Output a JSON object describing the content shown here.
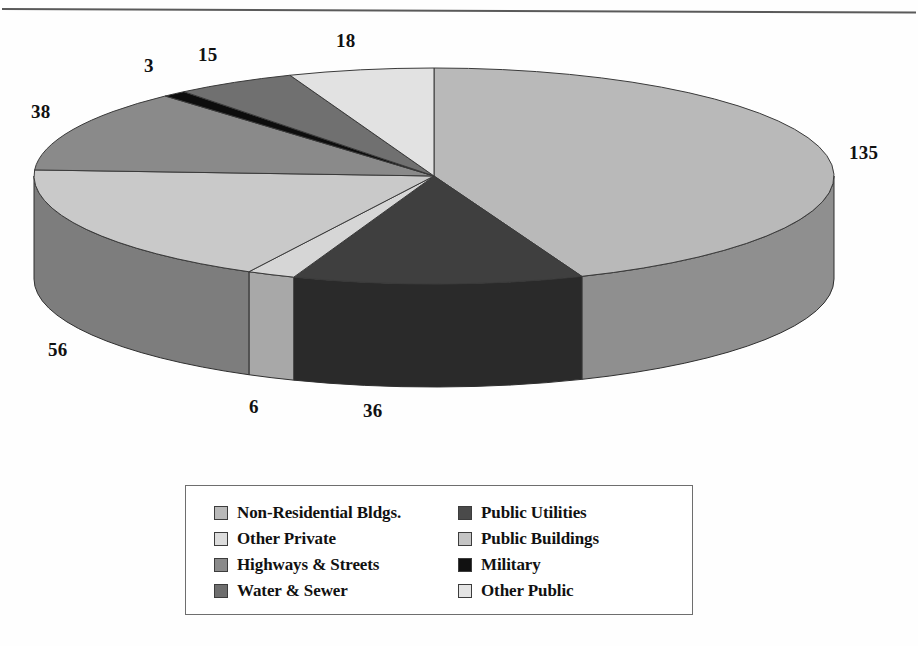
{
  "chart_data": {
    "type": "pie",
    "title": "",
    "subtitle": "",
    "xlabel": "",
    "ylabel": "",
    "total": 307,
    "units": "",
    "legend_position": "bottom",
    "grid": false,
    "three_d": true,
    "categories": [
      "Non-Residential Bldgs.",
      "Public Utilities",
      "Public Buildings",
      "Other Private",
      "Highways & Streets",
      "Military",
      "Water & Sewer",
      "Other Public"
    ],
    "values": [
      135,
      36,
      6,
      56,
      38,
      3,
      15,
      18
    ],
    "data_labels": [
      "135",
      "36",
      "6",
      "56",
      "38",
      "3",
      "15",
      "18"
    ],
    "colors": [
      "#b9b9b9",
      "#3f3f3f",
      "#d6d6d6",
      "#c9c9c9",
      "#8a8a8a",
      "#0d0d0d",
      "#707070",
      "#e2e2e2"
    ],
    "slices": [
      {
        "label": "Non-Residential Bldgs.",
        "value": 135,
        "data_label": "135",
        "color": "#b9b9b9",
        "side_color": "#8f8f8f"
      },
      {
        "label": "Public Utilities",
        "value": 36,
        "data_label": "36",
        "color": "#3f3f3f",
        "side_color": "#2a2a2a"
      },
      {
        "label": "Public Buildings",
        "value": 6,
        "data_label": "6",
        "color": "#d6d6d6",
        "side_color": "#a8a8a8"
      },
      {
        "label": "Other Private",
        "value": 56,
        "data_label": "56",
        "color": "#c9c9c9",
        "side_color": "#7d7d7d"
      },
      {
        "label": "Highways & Streets",
        "value": 38,
        "data_label": "38",
        "color": "#8a8a8a",
        "side_color": "#6a6a6a"
      },
      {
        "label": "Military",
        "value": 3,
        "data_label": "3",
        "color": "#0d0d0d",
        "side_color": "#0d0d0d"
      },
      {
        "label": "Water & Sewer",
        "value": 15,
        "data_label": "15",
        "color": "#707070",
        "side_color": "#5a5a5a"
      },
      {
        "label": "Other Public",
        "value": 18,
        "data_label": "18",
        "color": "#e2e2e2",
        "side_color": "#b0b0b0"
      }
    ]
  },
  "labels": {
    "v135": "135",
    "v36": "36",
    "v6": "6",
    "v56": "56",
    "v38": "38",
    "v3": "3",
    "v15": "15",
    "v18": "18"
  },
  "legend": {
    "column_left": [
      {
        "label": "Non-Residential Bldgs.",
        "color": "#b9b9b9"
      },
      {
        "label": "Other Private",
        "color": "#dcdcdc"
      },
      {
        "label": "Highways & Streets",
        "color": "#8a8a8a"
      },
      {
        "label": "Water & Sewer",
        "color": "#6e6e6e"
      }
    ],
    "column_right": [
      {
        "label": "Public Utilities",
        "color": "#4a4a4a"
      },
      {
        "label": "Public Buildings",
        "color": "#c4c4c4"
      },
      {
        "label": "Military",
        "color": "#111111"
      },
      {
        "label": "Other Public",
        "color": "#e4e4e4"
      }
    ]
  }
}
